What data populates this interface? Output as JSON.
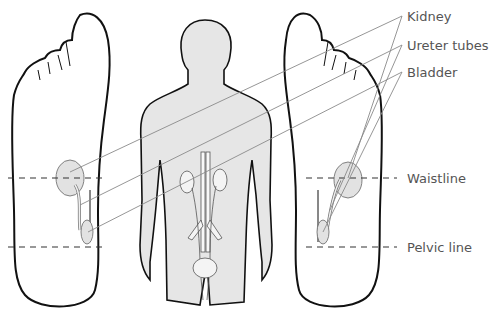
{
  "diagram": {
    "type": "foot reflexology diagram",
    "labels": {
      "kidney": "Kidney",
      "ureter": "Ureter tubes",
      "bladder": "Bladder",
      "waistline": "Waistline",
      "pelvic": "Pelvic line"
    },
    "colors": {
      "outline": "#111111",
      "fill_body": "#e6e6e6",
      "organ_fill": "#e2e2e2",
      "leader_line": "#8a8a8a",
      "label_text": "#555555"
    }
  }
}
